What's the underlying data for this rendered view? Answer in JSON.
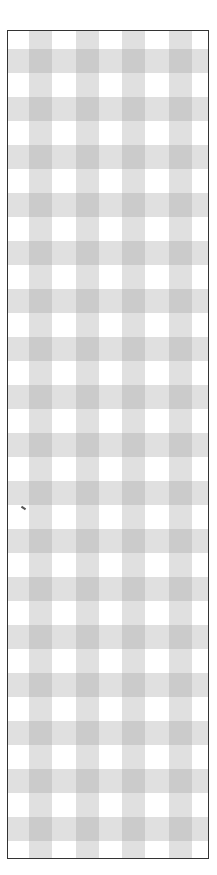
{
  "pattern": {
    "type": "gingham",
    "band_color": "#a0a0a0",
    "background_color": "#ffffff",
    "border_color": "#333333",
    "vertical_bands_x": [
      21,
      68,
      114,
      161
    ],
    "horizontal_band_period": 48,
    "horizontal_band_start": 18,
    "horizontal_band_count": 17
  }
}
